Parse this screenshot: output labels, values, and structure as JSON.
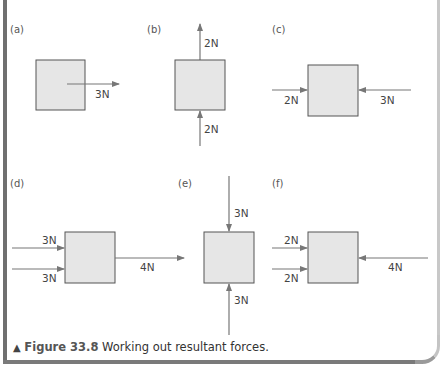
{
  "figure": {
    "caption_marker": "▲",
    "caption_label": "Figure 33.8",
    "caption_text": "Working out resultant forces."
  },
  "colors": {
    "box_fill": "#e6e6e6",
    "box_stroke": "#555555",
    "arrow": "#777777",
    "frame_dark": "#6f6f6f",
    "frame_light": "#c8c8c8"
  },
  "panels": [
    {
      "id": "a",
      "label": "(a)",
      "forces": [
        {
          "magnitude": "3N",
          "direction": "right",
          "from": "center"
        }
      ]
    },
    {
      "id": "b",
      "label": "(b)",
      "forces": [
        {
          "magnitude": "2N",
          "direction": "up",
          "applied_at": "top"
        },
        {
          "magnitude": "2N",
          "direction": "up",
          "applied_at": "bottom"
        }
      ]
    },
    {
      "id": "c",
      "label": "(c)",
      "forces": [
        {
          "magnitude": "2N",
          "direction": "right",
          "applied_at": "left"
        },
        {
          "magnitude": "3N",
          "direction": "left",
          "applied_at": "right"
        }
      ]
    },
    {
      "id": "d",
      "label": "(d)",
      "forces": [
        {
          "magnitude": "3N",
          "direction": "right",
          "applied_at": "left-upper"
        },
        {
          "magnitude": "3N",
          "direction": "right",
          "applied_at": "left-lower"
        },
        {
          "magnitude": "4N",
          "direction": "right",
          "applied_at": "right"
        }
      ]
    },
    {
      "id": "e",
      "label": "(e)",
      "forces": [
        {
          "magnitude": "3N",
          "direction": "down",
          "applied_at": "top"
        },
        {
          "magnitude": "3N",
          "direction": "up",
          "applied_at": "bottom"
        }
      ]
    },
    {
      "id": "f",
      "label": "(f)",
      "forces": [
        {
          "magnitude": "2N",
          "direction": "right",
          "applied_at": "left-upper"
        },
        {
          "magnitude": "2N",
          "direction": "right",
          "applied_at": "left-lower"
        },
        {
          "magnitude": "4N",
          "direction": "left",
          "applied_at": "right"
        }
      ]
    }
  ]
}
